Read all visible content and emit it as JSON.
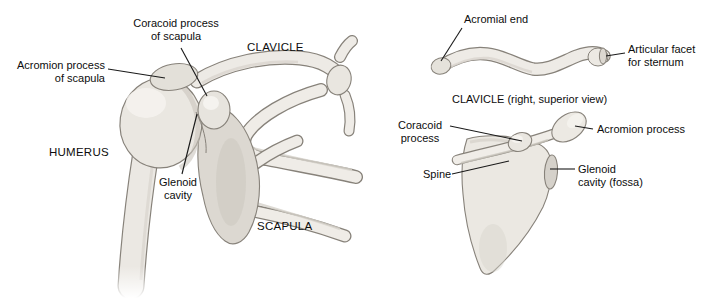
{
  "figure": {
    "colors": {
      "background": "#ffffff",
      "bone_fill": "#edeae5",
      "bone_fill_dark": "#dcd8d1",
      "bone_shade": "#d3cfc8",
      "bone_outline": "#87827a",
      "leader_line": "#1a1a1a",
      "text": "#0d0d0d"
    },
    "left_panel": {
      "view_name": "shoulder-joint-anterior-view",
      "labels": {
        "coracoid_process": "Coracoid process\nof scapula",
        "clavicle": "CLAVICLE",
        "acromion_process": "Acromion process\nof scapula",
        "humerus": "HUMERUS",
        "glenoid_cavity": "Glenoid\ncavity",
        "scapula": "SCAPULA"
      }
    },
    "right_panel": {
      "clavicle_view": {
        "labels": {
          "acromial_end": "Acromial end",
          "articular_facet": "Articular facet\nfor sternum",
          "caption": "CLAVICLE (right, superior view)"
        }
      },
      "scapula_view": {
        "labels": {
          "coracoid_process": "Coracoid\nprocess",
          "acromion_process": "Acromion process",
          "spine": "Spine",
          "glenoid_cavity": "Glenoid\ncavity (fossa)"
        }
      }
    }
  }
}
